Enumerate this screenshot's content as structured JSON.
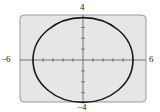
{
  "chart_data": {
    "type": "line",
    "title": "",
    "xlabel": "",
    "ylabel": "",
    "xlim": [
      -6,
      6
    ],
    "ylim": [
      -4,
      4
    ],
    "tick_labels": {
      "x_min": "−6",
      "x_max": "6",
      "y_min": "−4",
      "y_max": "4"
    },
    "x_tick_step": 1,
    "y_tick_step": 1,
    "grid": false,
    "legend": null,
    "series": [
      {
        "name": "ellipse",
        "shape": "ellipse",
        "center": [
          0,
          0
        ],
        "semi_axis_x": 5,
        "semi_axis_y_approx": 3.9,
        "color": "#1a1a1a"
      }
    ]
  },
  "colors": {
    "plot_background": "#e6e6e6",
    "frame": "#9a9a9a",
    "axis": "#555555",
    "curve": "#1a1a1a"
  }
}
